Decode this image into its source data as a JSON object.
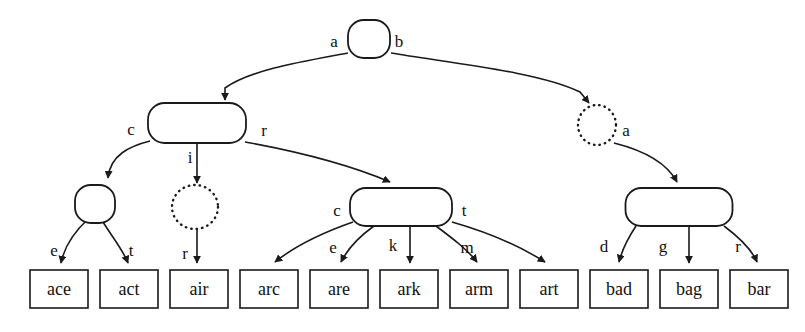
{
  "diagram": {
    "kind": "trie-dawg",
    "title": "",
    "background_color": "#ffffff",
    "stroke_color": "#1a1a1a",
    "nodes": [
      {
        "id": "root",
        "shape": "rounded-rect",
        "style": "solid",
        "x": 369,
        "y": 39,
        "w": 42,
        "h": 38
      },
      {
        "id": "n_a",
        "shape": "rounded-rect",
        "style": "solid",
        "x": 197,
        "y": 123,
        "w": 98,
        "h": 40
      },
      {
        "id": "n_b",
        "shape": "circle",
        "style": "dotted",
        "x": 597,
        "y": 125,
        "w": 38,
        "h": 40
      },
      {
        "id": "n_ac",
        "shape": "rounded-rect",
        "style": "solid",
        "x": 95,
        "y": 204,
        "w": 40,
        "h": 38
      },
      {
        "id": "n_ai",
        "shape": "circle",
        "style": "dotted",
        "x": 195,
        "y": 207,
        "w": 46,
        "h": 44
      },
      {
        "id": "n_ar",
        "shape": "rounded-rect",
        "style": "solid",
        "x": 401,
        "y": 207,
        "w": 102,
        "h": 38
      },
      {
        "id": "n_ba",
        "shape": "rounded-rect",
        "style": "solid",
        "x": 679,
        "y": 207,
        "w": 107,
        "h": 38
      }
    ],
    "edges": [
      {
        "from": "root",
        "to": "n_a",
        "label": "a"
      },
      {
        "from": "root",
        "to": "n_b",
        "label": "b"
      },
      {
        "from": "n_a",
        "to": "n_ac",
        "label": "c"
      },
      {
        "from": "n_a",
        "to": "n_ai",
        "label": "i"
      },
      {
        "from": "n_a",
        "to": "n_ar",
        "label": "r"
      },
      {
        "from": "n_b",
        "to": "n_ba",
        "label": "a"
      },
      {
        "from": "n_ac",
        "to": "leaf0",
        "label": "e"
      },
      {
        "from": "n_ac",
        "to": "leaf1",
        "label": "t"
      },
      {
        "from": "n_ai",
        "to": "leaf2",
        "label": "r"
      },
      {
        "from": "n_ar",
        "to": "leaf3",
        "label": "c"
      },
      {
        "from": "n_ar",
        "to": "leaf4",
        "label": "e"
      },
      {
        "from": "n_ar",
        "to": "leaf5",
        "label": "k"
      },
      {
        "from": "n_ar",
        "to": "leaf6",
        "label": "m"
      },
      {
        "from": "n_ar",
        "to": "leaf7",
        "label": "t"
      },
      {
        "from": "n_ba",
        "to": "leaf8",
        "label": "d"
      },
      {
        "from": "n_ba",
        "to": "leaf9",
        "label": "g"
      },
      {
        "from": "n_ba",
        "to": "leaf10",
        "label": "r"
      }
    ],
    "edge_labels": [
      {
        "text": "a",
        "x": 334,
        "y": 47
      },
      {
        "text": "b",
        "x": 399,
        "y": 47
      },
      {
        "text": "c",
        "x": 131,
        "y": 135
      },
      {
        "text": "i",
        "x": 190,
        "y": 163
      },
      {
        "text": "r",
        "x": 264,
        "y": 136
      },
      {
        "text": "a",
        "x": 626,
        "y": 136
      },
      {
        "text": "e",
        "x": 54,
        "y": 256
      },
      {
        "text": "t",
        "x": 131,
        "y": 256
      },
      {
        "text": "r",
        "x": 185,
        "y": 259
      },
      {
        "text": "c",
        "x": 337,
        "y": 216
      },
      {
        "text": "e",
        "x": 333,
        "y": 253
      },
      {
        "text": "k",
        "x": 393,
        "y": 251
      },
      {
        "text": "m",
        "x": 467,
        "y": 253
      },
      {
        "text": "t",
        "x": 464,
        "y": 216
      },
      {
        "text": "d",
        "x": 604,
        "y": 252
      },
      {
        "text": "g",
        "x": 663,
        "y": 252
      },
      {
        "text": "r",
        "x": 738,
        "y": 252
      }
    ],
    "leaves": [
      {
        "id": "leaf0",
        "label": "ace",
        "x": 30,
        "y": 270,
        "w": 58,
        "h": 38
      },
      {
        "id": "leaf1",
        "label": "act",
        "x": 100,
        "y": 270,
        "w": 58,
        "h": 38
      },
      {
        "id": "leaf2",
        "label": "air",
        "x": 170,
        "y": 270,
        "w": 58,
        "h": 38
      },
      {
        "id": "leaf3",
        "label": "arc",
        "x": 240,
        "y": 270,
        "w": 58,
        "h": 38
      },
      {
        "id": "leaf4",
        "label": "are",
        "x": 310,
        "y": 270,
        "w": 58,
        "h": 38
      },
      {
        "id": "leaf5",
        "label": "ark",
        "x": 380,
        "y": 270,
        "w": 58,
        "h": 38
      },
      {
        "id": "leaf6",
        "label": "arm",
        "x": 450,
        "y": 270,
        "w": 58,
        "h": 38
      },
      {
        "id": "leaf7",
        "label": "art",
        "x": 520,
        "y": 270,
        "w": 58,
        "h": 38
      },
      {
        "id": "leaf8",
        "label": "bad",
        "x": 590,
        "y": 270,
        "w": 58,
        "h": 38
      },
      {
        "id": "leaf9",
        "label": "bag",
        "x": 660,
        "y": 270,
        "w": 58,
        "h": 38
      },
      {
        "id": "leaf10",
        "label": "bar",
        "x": 730,
        "y": 270,
        "w": 58,
        "h": 38
      }
    ],
    "paths": [
      {
        "name": "root-to-a",
        "d": "M 348,53 C 300,62 250,70 225,88 L 225,100"
      },
      {
        "name": "root-to-b",
        "d": "M 391,53 C 450,63 540,72 580,92 L 589,103"
      },
      {
        "name": "a-to-ac",
        "d": "M 150,141 C 130,146 110,155 108,178"
      },
      {
        "name": "a-to-ai",
        "d": "M 197,143 L 197,183"
      },
      {
        "name": "a-to-ar",
        "d": "M 245,142 C 300,152 350,165 390,182"
      },
      {
        "name": "b-to-ba",
        "d": "M 614,143 C 650,152 668,165 677,182"
      },
      {
        "name": "ac-to-ace",
        "d": "M 88,219 C 72,234 64,248 61,263"
      },
      {
        "name": "ac-to-act",
        "d": "M 103,222 C 113,238 123,250 128,263"
      },
      {
        "name": "ai-to-air",
        "d": "M 197,230 L 197,263"
      },
      {
        "name": "ar-to-arc",
        "d": "M 353,222 C 330,230 300,242 275,262"
      },
      {
        "name": "ar-to-are",
        "d": "M 374,226 C 360,236 348,248 341,262"
      },
      {
        "name": "ar-to-ark",
        "d": "M 410,226 L 410,263"
      },
      {
        "name": "ar-to-arm",
        "d": "M 436,226 C 452,238 468,250 477,262"
      },
      {
        "name": "ar-to-art",
        "d": "M 452,222 C 480,230 515,243 545,262"
      },
      {
        "name": "ba-to-bad",
        "d": "M 636,226 C 628,238 622,250 619,262"
      },
      {
        "name": "ba-to-bag",
        "d": "M 689,226 L 689,263"
      },
      {
        "name": "ba-to-bar",
        "d": "M 724,226 C 740,238 752,250 757,262"
      }
    ]
  }
}
